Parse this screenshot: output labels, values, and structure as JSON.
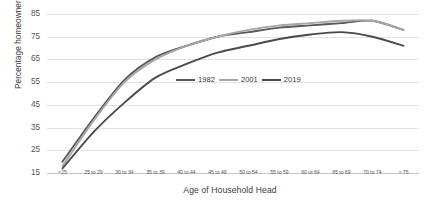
{
  "chart_data": {
    "type": "line",
    "title": "",
    "xlabel": "Age of Household Head",
    "ylabel": "Percentage homeowners",
    "ylim": [
      15,
      85
    ],
    "yticks": [
      15,
      25,
      35,
      45,
      55,
      65,
      75,
      85
    ],
    "grid": true,
    "legend_position": "center",
    "categories": [
      "<25",
      "25 to 29",
      "30 to 34",
      "35 to 39",
      "40 to 44",
      "45 to 49",
      "50 to 54",
      "55 to 59",
      "60 to 64",
      "65 to 69",
      "70 to 74",
      "> 75"
    ],
    "series": [
      {
        "name": "1982",
        "color": "#595959",
        "values": [
          20,
          39,
          56,
          66,
          71,
          75,
          77,
          79,
          80,
          81,
          82,
          78
        ]
      },
      {
        "name": "2001",
        "color": "#a6a6a6",
        "values": [
          18,
          38,
          55,
          65,
          71,
          75,
          78,
          80,
          81,
          82,
          82,
          78
        ]
      },
      {
        "name": "2019",
        "color": "#4a4a4a",
        "values": [
          17,
          33,
          46,
          57,
          63,
          68,
          71,
          74,
          76,
          77,
          75,
          71
        ]
      }
    ]
  },
  "axes": {
    "ytitle": "Percentage homeowners",
    "xtitle": "Age of Household Head"
  },
  "legend": {
    "items": [
      {
        "label": "1982",
        "color": "#595959"
      },
      {
        "label": "2001",
        "color": "#a6a6a6"
      },
      {
        "label": "2019",
        "color": "#4a4a4a"
      }
    ]
  }
}
